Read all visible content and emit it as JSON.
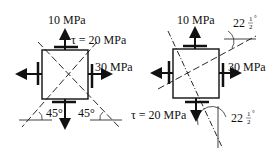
{
  "diagram": {
    "left": {
      "normal_top_label": "10 MPa",
      "shear_label": "τ = 20 MPa",
      "normal_right_label": "30 MPa",
      "angle_left": "45°",
      "angle_right": "45°"
    },
    "right": {
      "normal_top_label": "10 MPa",
      "normal_right_label": "30 MPa",
      "shear_label": "τ = 20 MPa",
      "angle_top_whole": "22",
      "angle_top_frac_num": "1",
      "angle_top_frac_den": "2",
      "angle_top_deg": "°",
      "angle_bottom_whole": "22",
      "angle_bottom_frac_num": "1",
      "angle_bottom_frac_den": "2",
      "angle_bottom_deg": "°"
    },
    "colors": {
      "ink": "#111111",
      "background": "#ffffff"
    }
  }
}
